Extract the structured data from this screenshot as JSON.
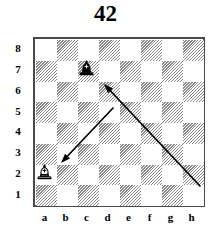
{
  "title": "42",
  "board": {
    "files": [
      "a",
      "b",
      "c",
      "d",
      "e",
      "f",
      "g",
      "h"
    ],
    "ranks": [
      "8",
      "7",
      "6",
      "5",
      "4",
      "3",
      "2",
      "1"
    ],
    "light_square_color": "#ffffff",
    "dark_square_color": "#8a8a8a",
    "border_color": "#4a4a4a",
    "dark_square_style": "diagonal-hatch",
    "orientation": "white-bottom",
    "squares_per_side": 8
  },
  "pieces": [
    {
      "id": "black-bishop",
      "type": "bishop",
      "color": "black",
      "square": "c7",
      "file": "c",
      "rank": "7",
      "glyph": "bishop-black-icon"
    },
    {
      "id": "white-bishop",
      "type": "bishop",
      "color": "white",
      "square": "a2",
      "file": "a",
      "rank": "2",
      "glyph": "bishop-white-icon"
    }
  ],
  "arrows": [
    {
      "id": "arrow-short",
      "label": "d5-b3",
      "from_square": "d5",
      "to_square": "b3",
      "direction": "down-left",
      "color": "#000000",
      "x1": 113,
      "y1": 108,
      "x2": 61,
      "y2": 163
    },
    {
      "id": "arrow-long",
      "label": "h2-c7",
      "from_square": "h2",
      "to_square": "c7",
      "direction": "up-left",
      "color": "#000000",
      "x1": 200,
      "y1": 186,
      "x2": 104,
      "y2": 84
    }
  ],
  "colors": {
    "background": "#ffffff",
    "ink": "#000000",
    "frame": "#4a4a4a",
    "hatch": "#8a8a8a"
  }
}
